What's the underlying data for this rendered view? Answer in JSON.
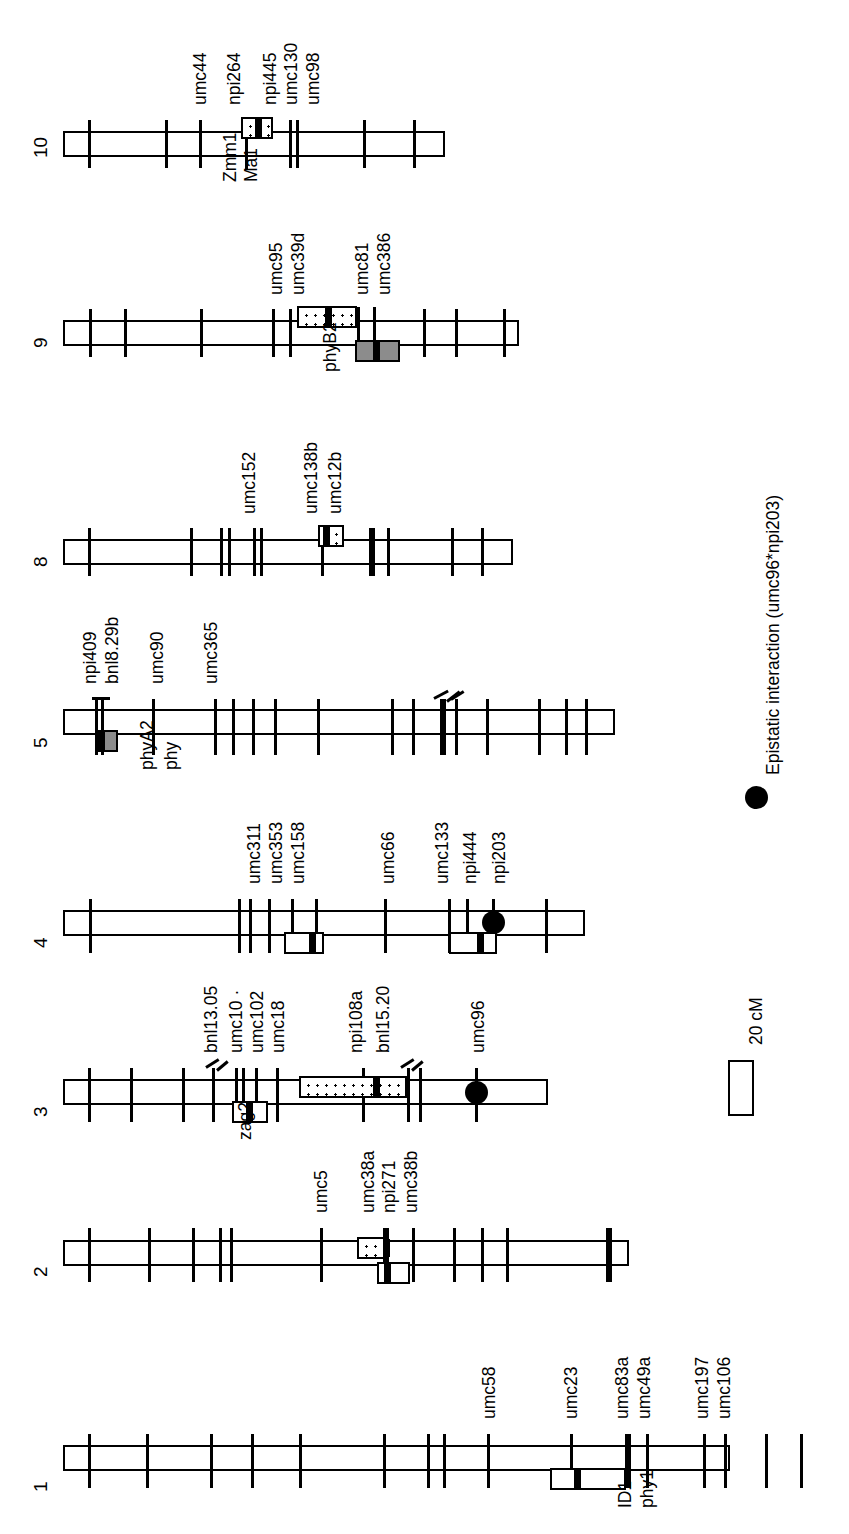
{
  "figure": {
    "type": "genetic-linkage-map",
    "organism_map": "maize",
    "orientation": "rotated-90-ccw",
    "chromosomes_shown": [
      "1",
      "2",
      "3",
      "4",
      "5",
      "8",
      "9",
      "10"
    ]
  },
  "legend": {
    "epistasis": {
      "symbol": "filled-circle",
      "label": "Epistatic interaction (umc96*npi203)"
    },
    "scale": {
      "label": "20 cM",
      "symbol": "open-rectangle"
    }
  },
  "chromosomes": [
    {
      "id": "10",
      "number": "10",
      "markers_above": [
        "umc44",
        "npi264",
        "npi445",
        "umc130",
        "umc98"
      ],
      "markers_below": [
        "Zmm1",
        "Ma1"
      ],
      "qtl": [
        {
          "style": "dotted",
          "side": "above",
          "peak": true
        }
      ],
      "epistasis_dots": 0
    },
    {
      "id": "9",
      "number": "9",
      "markers_above": [
        "umc95",
        "umc39d",
        "umc81",
        "umc386"
      ],
      "markers_below": [
        "phyB2"
      ],
      "qtl": [
        {
          "style": "dotted",
          "side": "above",
          "peak": true
        },
        {
          "style": "grey",
          "side": "below",
          "peak": true
        }
      ],
      "epistasis_dots": 0
    },
    {
      "id": "8",
      "number": "8",
      "markers_above": [
        "umc152",
        "umc138b",
        "umc12b"
      ],
      "markers_below": [],
      "qtl": [
        {
          "style": "dotted",
          "side": "above",
          "peak": true
        }
      ],
      "epistasis_dots": 0
    },
    {
      "id": "5",
      "number": "5",
      "markers_above": [
        "npi409",
        "bnl8.29b",
        "umc90",
        "umc365"
      ],
      "markers_below": [
        "phyA2",
        "phy"
      ],
      "qtl": [
        {
          "style": "grey",
          "side": "below",
          "peak": true
        }
      ],
      "epistasis_dots": 0
    },
    {
      "id": "4",
      "number": "4",
      "markers_above": [
        "umc311",
        "umc353",
        "umc158",
        "umc66",
        "umc133",
        "npi444",
        "npi203"
      ],
      "markers_below": [],
      "qtl": [
        {
          "style": "white",
          "side": "below",
          "peak": true
        },
        {
          "style": "white",
          "side": "below",
          "peak": true
        }
      ],
      "epistasis_dots": 1
    },
    {
      "id": "3",
      "number": "3",
      "markers_above": [
        "bnl13.05",
        "umc10 ·",
        "umc102",
        "umc18",
        "npi108a",
        "bnl15.20",
        "umc96"
      ],
      "markers_below": [
        "zag2"
      ],
      "qtl": [
        {
          "style": "white",
          "side": "below",
          "peak": true
        },
        {
          "style": "dotted",
          "side": "above",
          "peak": true
        }
      ],
      "epistasis_dots": 1
    },
    {
      "id": "2",
      "number": "2",
      "markers_above": [
        "umc5",
        "umc38a",
        "npi271",
        "umc38b"
      ],
      "markers_below": [],
      "qtl": [
        {
          "style": "dotted",
          "side": "above",
          "peak": true
        },
        {
          "style": "white",
          "side": "below",
          "peak": true
        }
      ],
      "epistasis_dots": 0
    },
    {
      "id": "1",
      "number": "1",
      "markers_above": [
        "umc58",
        "umc23",
        "umc83a",
        "umc49a",
        "umc197",
        "umc106"
      ],
      "markers_below": [
        "ID1",
        "phy1"
      ],
      "qtl": [
        {
          "style": "white",
          "side": "below",
          "peak": true
        }
      ],
      "epistasis_dots": 0
    }
  ],
  "labels": {
    "c10": {
      "m0": "umc44",
      "m1": "npi264",
      "m2": "npi445",
      "m3": "umc130",
      "m4": "umc98",
      "b0": "Zmm1",
      "b1": "Ma1",
      "num": "10"
    },
    "c9": {
      "m0": "umc95",
      "m1": "umc39d",
      "m2": "umc81",
      "m3": "umc386",
      "b0": "phyB2",
      "num": "9"
    },
    "c8": {
      "m0": "umc152",
      "m1": "umc138b",
      "m2": "umc12b",
      "num": "8"
    },
    "c5": {
      "m0": "npi409",
      "m1": "bnl8.29b",
      "m2": "umc90",
      "m3": "umc365",
      "b0": "phyA2",
      "b1": "phy",
      "num": "5"
    },
    "c4": {
      "m0": "umc311",
      "m1": "umc353",
      "m2": "umc158",
      "m3": "umc66",
      "m4": "umc133",
      "m5": "npi444",
      "m6": "npi203",
      "num": "4"
    },
    "c3": {
      "m0": "bnl13.05",
      "m1": "umc10 ·",
      "m2": "umc102",
      "m3": "umc18",
      "m4": "npi108a",
      "m5": "bnl15.20",
      "m6": "umc96",
      "b0": "zag2",
      "num": "3"
    },
    "c2": {
      "m0": "umc5",
      "m1": "umc38a",
      "m2": "npi271",
      "m3": "umc38b",
      "num": "2"
    },
    "c1": {
      "m0": "umc58",
      "m1": "umc23",
      "m2": "umc83a",
      "m3": "umc49a",
      "m4": "umc197",
      "m5": "umc106",
      "b0": "ID1",
      "b1": "phy1",
      "num": "1"
    }
  }
}
